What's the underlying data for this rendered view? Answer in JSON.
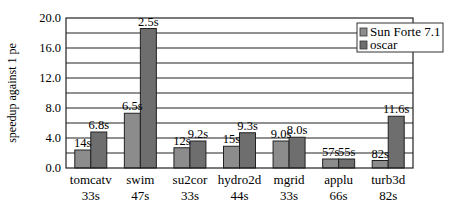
{
  "chart_data": {
    "type": "bar",
    "title": "",
    "xlabel": "",
    "ylabel": "speedup against 1 pe",
    "ylim": [
      0,
      20
    ],
    "yticks": [
      "0.0",
      "4.0",
      "8.0",
      "12.0",
      "16.0",
      "20.0"
    ],
    "grid_step": 2.0,
    "grid": true,
    "legend_position": "upper right, inside",
    "categories": [
      "tomcatv",
      "swim",
      "su2cor",
      "hydro2d",
      "mgrid",
      "applu",
      "turb3d"
    ],
    "category_times": [
      "33s",
      "47s",
      "33s",
      "44s",
      "33s",
      "66s",
      "82s"
    ],
    "series": [
      {
        "name": "Sun Forte 7.1",
        "color": "#8c8c8c",
        "values": [
          2.4,
          7.3,
          2.7,
          2.9,
          3.6,
          1.2,
          1.0
        ],
        "labels": [
          "14s",
          "6.5s",
          "12s",
          "15s",
          "9.0s",
          "57s",
          "82s"
        ]
      },
      {
        "name": "oscar",
        "color": "#6e6e6e",
        "values": [
          4.8,
          18.6,
          3.6,
          4.7,
          4.1,
          1.2,
          6.9
        ],
        "labels": [
          "6.8s",
          "2.5s",
          "9.2s",
          "9.3s",
          "8.0s",
          "55s",
          "11.6s"
        ]
      }
    ]
  }
}
